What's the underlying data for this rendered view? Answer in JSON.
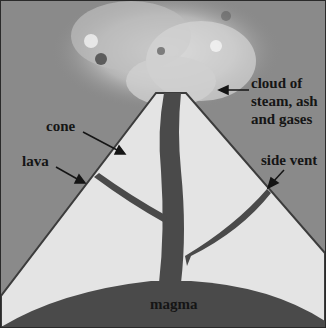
{
  "diagram": {
    "labels": {
      "cloud": [
        "cloud of",
        "steam, ash",
        "and gases"
      ],
      "cone": "cone",
      "lava": "lava",
      "side_vent": "side vent",
      "magma": "magma"
    },
    "colors": {
      "sky": "#8a8a8a",
      "cone": "#e4e4e4",
      "magma": "#4a4a4a",
      "cloud": "#c8c8c8",
      "text": "#151515"
    }
  }
}
